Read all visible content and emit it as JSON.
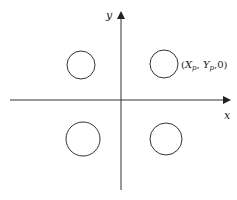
{
  "diagram": {
    "axes": {
      "x_label": "x",
      "y_label": "y"
    },
    "point_label": {
      "open": "(",
      "X": "X",
      "X_sub": "p",
      "sep1": ", ",
      "Y": "Y",
      "Y_sub": "p",
      "sep2": ",",
      "Z": "0",
      "close": ")"
    },
    "circles": [
      {
        "name": "top-left",
        "cx": 81,
        "cy": 65,
        "r": 14
      },
      {
        "name": "top-right",
        "cx": 164,
        "cy": 64,
        "r": 14
      },
      {
        "name": "bottom-left",
        "cx": 83,
        "cy": 139,
        "r": 17
      },
      {
        "name": "bottom-right",
        "cx": 166,
        "cy": 139,
        "r": 16
      }
    ],
    "colors": {
      "stroke": "#333333",
      "background": "#ffffff"
    }
  }
}
